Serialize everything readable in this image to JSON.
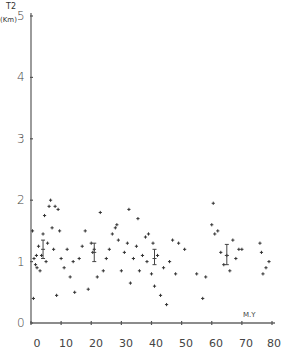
{
  "chart_data": {
    "type": "scatter",
    "title": "",
    "ylabel": "T2",
    "yunit": "(Km)",
    "xlabel": "M.Y",
    "xlim": [
      0,
      80
    ],
    "ylim": [
      0,
      5
    ],
    "x_ticks": [
      0,
      10,
      20,
      30,
      40,
      50,
      60,
      70,
      80
    ],
    "y_ticks": [
      0,
      1,
      2,
      3,
      4,
      5
    ],
    "grid": false,
    "legend": null,
    "marker": "+",
    "points": [
      [
        0.5,
        1.5
      ],
      [
        0.8,
        0.4
      ],
      [
        1.0,
        1.05
      ],
      [
        1.5,
        0.95
      ],
      [
        1.8,
        1.1
      ],
      [
        2.0,
        0.9
      ],
      [
        2.5,
        1.25
      ],
      [
        3.0,
        0.85
      ],
      [
        3.5,
        1.1
      ],
      [
        4.0,
        1.45
      ],
      [
        4.5,
        1.75
      ],
      [
        5.0,
        1.0
      ],
      [
        5.5,
        1.3
      ],
      [
        6.0,
        1.9
      ],
      [
        6.5,
        2.0
      ],
      [
        7.0,
        1.55
      ],
      [
        7.5,
        1.2
      ],
      [
        8.0,
        1.9
      ],
      [
        8.5,
        0.45
      ],
      [
        9.0,
        1.85
      ],
      [
        9.5,
        1.5
      ],
      [
        10.0,
        1.05
      ],
      [
        11.0,
        0.9
      ],
      [
        12.0,
        1.2
      ],
      [
        13.0,
        0.75
      ],
      [
        14.0,
        1.0
      ],
      [
        14.5,
        0.5
      ],
      [
        16.0,
        1.05
      ],
      [
        17.0,
        1.25
      ],
      [
        18.0,
        1.5
      ],
      [
        19.0,
        0.55
      ],
      [
        20.0,
        1.3
      ],
      [
        20.5,
        1.15
      ],
      [
        21.0,
        1.2
      ],
      [
        22.0,
        0.75
      ],
      [
        23.0,
        1.8
      ],
      [
        24.0,
        0.85
      ],
      [
        25.0,
        1.05
      ],
      [
        26.0,
        1.2
      ],
      [
        27.0,
        1.45
      ],
      [
        28.0,
        1.55
      ],
      [
        28.5,
        1.6
      ],
      [
        29.0,
        1.35
      ],
      [
        30.0,
        0.85
      ],
      [
        31.0,
        1.15
      ],
      [
        32.0,
        1.3
      ],
      [
        32.5,
        1.85
      ],
      [
        33.0,
        0.65
      ],
      [
        34.0,
        1.05
      ],
      [
        35.0,
        1.25
      ],
      [
        35.5,
        1.7
      ],
      [
        36.0,
        0.85
      ],
      [
        37.0,
        1.1
      ],
      [
        38.0,
        1.4
      ],
      [
        38.5,
        1.0
      ],
      [
        39.0,
        1.45
      ],
      [
        40.0,
        0.8
      ],
      [
        40.5,
        1.3
      ],
      [
        41.0,
        0.6
      ],
      [
        42.0,
        1.1
      ],
      [
        43.0,
        0.45
      ],
      [
        44.0,
        0.9
      ],
      [
        45.0,
        0.3
      ],
      [
        46.0,
        1.0
      ],
      [
        47.0,
        1.35
      ],
      [
        48.0,
        0.8
      ],
      [
        49.0,
        1.3
      ],
      [
        51.0,
        1.2
      ],
      [
        55.0,
        0.8
      ],
      [
        57.0,
        0.4
      ],
      [
        58.0,
        0.75
      ],
      [
        60.0,
        1.6
      ],
      [
        60.5,
        1.95
      ],
      [
        61.0,
        1.45
      ],
      [
        62.0,
        1.5
      ],
      [
        63.0,
        1.15
      ],
      [
        64.0,
        0.95
      ],
      [
        65.0,
        1.1
      ],
      [
        66.0,
        0.85
      ],
      [
        67.0,
        1.35
      ],
      [
        68.0,
        1.05
      ],
      [
        69.0,
        1.2
      ],
      [
        70.0,
        1.2
      ],
      [
        76.0,
        1.3
      ],
      [
        76.5,
        1.15
      ],
      [
        77.0,
        0.8
      ],
      [
        78.0,
        0.9
      ],
      [
        79.0,
        1.0
      ]
    ],
    "error_bars": [
      {
        "x": 4,
        "mean": 1.2,
        "low": 1.05,
        "high": 1.35
      },
      {
        "x": 21,
        "mean": 1.15,
        "low": 1.0,
        "high": 1.3
      },
      {
        "x": 41,
        "mean": 1.05,
        "low": 0.95,
        "high": 1.2
      },
      {
        "x": 65,
        "mean": 1.1,
        "low": 0.95,
        "high": 1.28
      }
    ]
  },
  "axis_labels": {
    "y_title": "T2",
    "y_unit": "(Km)",
    "x_unit": "M.Y",
    "y_ticks": [
      "0",
      "1",
      "2",
      "3",
      "4",
      "5"
    ],
    "x_ticks": [
      "0",
      "10",
      "20",
      "30",
      "40",
      "50",
      "60",
      "70",
      "80"
    ]
  }
}
